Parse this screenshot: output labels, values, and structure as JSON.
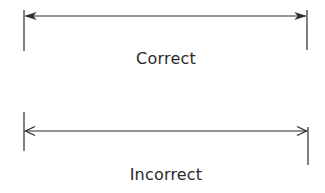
{
  "diagram": {
    "colors": {
      "line": "#2a2a2a",
      "text": "#2a2a2a",
      "background": "#ffffff"
    },
    "examples": [
      {
        "label": "Correct",
        "arrowhead_style": "filled",
        "extension_lines": "aligned",
        "left_extension": {
          "x": 24,
          "y1": 10,
          "y2": 51
        },
        "right_extension": {
          "x": 307,
          "y1": 10,
          "y2": 50
        },
        "dimension_line": {
          "x1": 24,
          "x2": 307,
          "y": 16
        }
      },
      {
        "label": "Incorrect",
        "arrowhead_style": "open",
        "extension_lines": "misaligned",
        "left_extension": {
          "x": 24,
          "y1": 112,
          "y2": 151
        },
        "right_extension": {
          "x": 308,
          "y1": 127,
          "y2": 165
        },
        "dimension_line": {
          "x1": 24,
          "x2": 308,
          "y": 131
        }
      }
    ]
  }
}
